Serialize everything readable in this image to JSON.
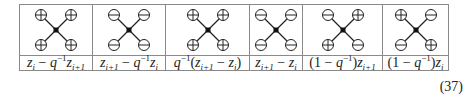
{
  "figure": {
    "columns": [
      {
        "width": 72,
        "signs": {
          "top_left": "plus",
          "top_right": "plus",
          "bottom_left": "plus",
          "bottom_right": "plus"
        },
        "label_parts": [
          [
            "i",
            "z"
          ],
          [
            "sub",
            "i"
          ],
          [
            "t",
            " − "
          ],
          [
            "i",
            "q"
          ],
          [
            "sup",
            "−1"
          ],
          [
            "i",
            "z"
          ],
          [
            "sub",
            "i+1"
          ]
        ],
        "label": "z_i − q^{−1} z_{i+1}"
      },
      {
        "width": 72,
        "signs": {
          "top_left": "minus",
          "top_right": "minus",
          "bottom_left": "minus",
          "bottom_right": "minus"
        },
        "label_parts": [
          [
            "i",
            "z"
          ],
          [
            "sub",
            "i+1"
          ],
          [
            "t",
            " − "
          ],
          [
            "i",
            "q"
          ],
          [
            "sup",
            "−1"
          ],
          [
            "i",
            "z"
          ],
          [
            "sub",
            "i"
          ]
        ],
        "label": "z_{i+1} − q^{−1} z_i"
      },
      {
        "width": 83,
        "signs": {
          "top_left": "plus",
          "top_right": "plus",
          "bottom_left": "plus",
          "bottom_right": "plus"
        },
        "label_parts": [
          [
            "i",
            "q"
          ],
          [
            "sup",
            "−1"
          ],
          [
            "t",
            "("
          ],
          [
            "i",
            "z"
          ],
          [
            "sub",
            "i+1"
          ],
          [
            "t",
            " − "
          ],
          [
            "i",
            "z"
          ],
          [
            "sub",
            "i"
          ],
          [
            "t",
            ")"
          ]
        ],
        "label": "q^{−1}(z_{i+1} − z_i)"
      },
      {
        "width": 52,
        "signs": {
          "top_left": "minus",
          "top_right": "minus",
          "bottom_left": "minus",
          "bottom_right": "minus"
        },
        "label_parts": [
          [
            "i",
            "z"
          ],
          [
            "sub",
            "i+1"
          ],
          [
            "t",
            " − "
          ],
          [
            "i",
            "z"
          ],
          [
            "sub",
            "i"
          ]
        ],
        "label": "z_{i+1} − z_i"
      },
      {
        "width": 79,
        "signs": {
          "top_left": "minus",
          "top_right": "plus",
          "bottom_left": "plus",
          "bottom_right": "minus"
        },
        "label_parts": [
          [
            "t",
            "(1 − "
          ],
          [
            "i",
            "q"
          ],
          [
            "sup",
            "−1"
          ],
          [
            "t",
            ")"
          ],
          [
            "i",
            "z"
          ],
          [
            "sub",
            "i+1"
          ]
        ],
        "label": "(1 − q^{−1}) z_{i+1}"
      },
      {
        "width": 65,
        "signs": {
          "top_left": "plus",
          "top_right": "minus",
          "bottom_left": "minus",
          "bottom_right": "plus"
        },
        "label_parts": [
          [
            "t",
            "(1 − "
          ],
          [
            "i",
            "q"
          ],
          [
            "sup",
            "−1"
          ],
          [
            "t",
            ")"
          ],
          [
            "i",
            "z"
          ],
          [
            "sub",
            "i"
          ]
        ],
        "label": "(1 − q^{−1}) z_i"
      }
    ],
    "equation_number": "(37)"
  },
  "colors": {
    "border": "#8a8a8a",
    "ink": "#222222",
    "background": "#ffffff"
  }
}
